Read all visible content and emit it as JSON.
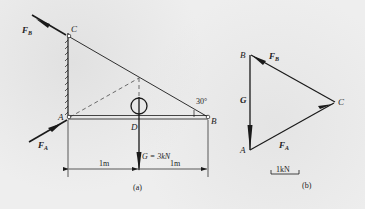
{
  "figure_a": {
    "caption": "(a)",
    "points": {
      "C": "C",
      "A": "A",
      "B": "B",
      "D": "D"
    },
    "forces": {
      "FB": {
        "main": "F",
        "sub": "B"
      },
      "FA": {
        "main": "F",
        "sub": "A"
      },
      "G": "G = 3kN"
    },
    "angle": "30°",
    "dimensions": [
      "1m",
      "1m"
    ]
  },
  "figure_b": {
    "caption": "(b)",
    "points": {
      "B": "B",
      "A": "A",
      "C": "C"
    },
    "forces": {
      "G": "G",
      "FB": {
        "main": "F",
        "sub": "B"
      },
      "FA": {
        "main": "F",
        "sub": "A"
      }
    },
    "scale": "1kN"
  },
  "colors": {
    "ink": "#1a1a1a",
    "background": "#eeeeee"
  }
}
